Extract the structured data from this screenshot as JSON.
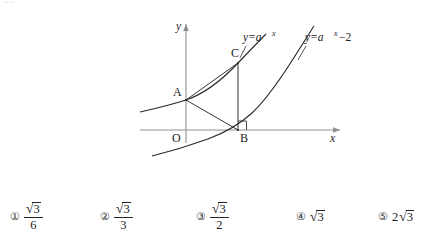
{
  "top_remnant": "....",
  "figure": {
    "axis": {
      "x_label": "x",
      "y_label": "y",
      "origin_label": "O"
    },
    "points": [
      {
        "id": "A",
        "label": "A"
      },
      {
        "id": "B",
        "label": "B"
      },
      {
        "id": "C",
        "label": "C"
      }
    ],
    "curve_labels": [
      {
        "id": "curve1",
        "text": "y=a",
        "exponent": "x",
        "suffix": ""
      },
      {
        "id": "curve2",
        "text": "y=a",
        "exponent": "x",
        "suffix": "−2"
      }
    ],
    "right_angle_at": "B"
  },
  "answers": [
    {
      "marker": "①",
      "kind": "fraction",
      "numer_coef": "",
      "numer_radicand": "3",
      "denom": "6"
    },
    {
      "marker": "②",
      "kind": "fraction",
      "numer_coef": "",
      "numer_radicand": "3",
      "denom": "3"
    },
    {
      "marker": "③",
      "kind": "fraction",
      "numer_coef": "",
      "numer_radicand": "3",
      "denom": "2"
    },
    {
      "marker": "④",
      "kind": "radical",
      "coef": "",
      "radicand": "3"
    },
    {
      "marker": "⑤",
      "kind": "radical",
      "coef": "2",
      "radicand": "3"
    }
  ],
  "colors": {
    "ink": "#1a1a1a",
    "axis": "#8a8a8a",
    "curve": "#2b2b2b"
  }
}
